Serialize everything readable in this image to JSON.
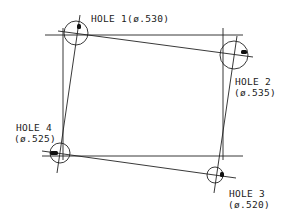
{
  "diagram": {
    "type": "hole-pattern-position-sketch",
    "line_color": "#222222",
    "holes": [
      {
        "id": 1,
        "label": "HOLE 1",
        "diameter": "(ø.530)",
        "label_full": "HOLE 1(ø.530)"
      },
      {
        "id": 2,
        "label": "HOLE 2",
        "diameter": "(ø.535)"
      },
      {
        "id": 3,
        "label": "HOLE 3",
        "diameter": "(ø.520)"
      },
      {
        "id": 4,
        "label": "HOLE 4",
        "diameter": "(ø.525)"
      }
    ]
  }
}
